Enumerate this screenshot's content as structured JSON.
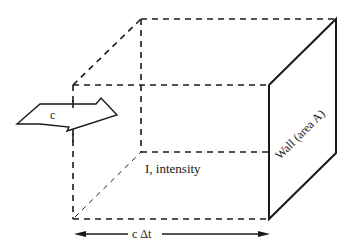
{
  "diagram": {
    "labels": {
      "velocity": "c",
      "intensity": "I, intensity",
      "wall": "Wall (area A)",
      "distance": "c Δt"
    },
    "colors": {
      "stroke": "#1a1a1a",
      "background": "#ffffff"
    },
    "elements": {
      "box": "dashed rectangular prism (volume of radiation)",
      "wall_face": "solid right face",
      "velocity_arrow": "block arrow pointing right",
      "length_arrow": "double-headed dimension arrow"
    }
  }
}
